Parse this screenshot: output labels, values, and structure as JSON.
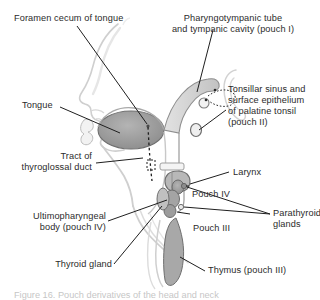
{
  "figure": {
    "type": "anatomical-illustration",
    "background_color": "#ffffff",
    "text_color": "#2b2b2b",
    "caption": "Figure 16. Pouch derivatives of the head and neck"
  },
  "labels": {
    "foramen_cecum": "Foramen cecum of tongue",
    "pharyngotympanic_l1": "Pharyngotympanic tube",
    "pharyngotympanic_l2": "and tympanic cavity (pouch I)",
    "tongue": "Tongue",
    "tonsillar_l1": "Tonsillar sinus and",
    "tonsillar_l2": "surface epithelium",
    "tonsillar_l3": "of palatine tonsil",
    "tonsillar_l4": "(pouch II)",
    "tract_l1": "Tract of",
    "tract_l2": "thyroglossal duct",
    "larynx": "Larynx",
    "pouch_iv": "Pouch IV",
    "ultimopharyngeal_l1": "Ultimopharyngeal",
    "ultimopharyngeal_l2": "body (pouch IV)",
    "parathyroid_l1": "Parathyroid",
    "parathyroid_l2": "glands",
    "pouch_iii": "Pouch III",
    "thyroid_gland": "Thyroid gland",
    "thymus": "Thymus (pouch III)"
  },
  "colors": {
    "outline": "#6d6d6d",
    "skin_fill": "#f4f4f4",
    "tongue_fill": "#9a9a9a",
    "pharynx_fill": "#d2d2d2",
    "pouch_fill": "#9e9e9e",
    "thymus_fill": "#a8a8a8",
    "leader_line": "#1f1f1f",
    "dotted_tract": "#1f1f1f"
  }
}
